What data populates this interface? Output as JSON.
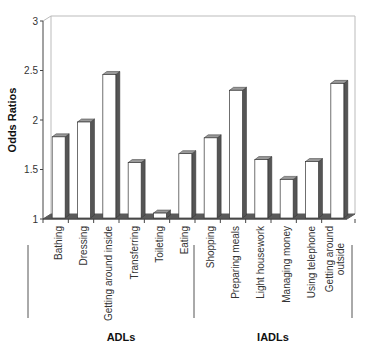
{
  "chart_data": {
    "type": "bar",
    "style": "3d-column",
    "title": "",
    "xlabel": "",
    "ylabel": "Odds Ratios",
    "ylim": [
      1,
      3
    ],
    "yticks": [
      "1",
      "1.5",
      "2",
      "2.5",
      "3"
    ],
    "grid": false,
    "legend": null,
    "categories": [
      "Bathing",
      "Dressing",
      "Getting around inside",
      "Transferring",
      "Toileting",
      "Eating",
      "Shopping",
      "Preparing meals",
      "Light housework",
      "Managing money",
      "Using telephone",
      "Getting around outside"
    ],
    "category_lines": [
      [
        "Bathing"
      ],
      [
        "Dressing"
      ],
      [
        "Getting around inside"
      ],
      [
        "Transferring"
      ],
      [
        "Toileting"
      ],
      [
        "Eating"
      ],
      [
        "Shopping"
      ],
      [
        "Preparing meals"
      ],
      [
        "Light housework"
      ],
      [
        "Managing money"
      ],
      [
        "Using telephone"
      ],
      [
        "Getting around",
        "outside"
      ]
    ],
    "values": [
      1.83,
      1.98,
      2.46,
      1.57,
      1.06,
      1.66,
      1.82,
      2.3,
      1.6,
      1.4,
      1.58,
      2.37
    ],
    "groups": [
      {
        "name": "ADLs",
        "start": 0,
        "end": 5
      },
      {
        "name": "IADLs",
        "start": 6,
        "end": 11
      }
    ]
  },
  "colors": {
    "bar_face": "#ffffff",
    "bar_side": "#555555",
    "bar_top": "#9a9a9a",
    "floor": "#5a5a5a",
    "axis": "#444444",
    "back_wall": "#bbbbbb"
  }
}
